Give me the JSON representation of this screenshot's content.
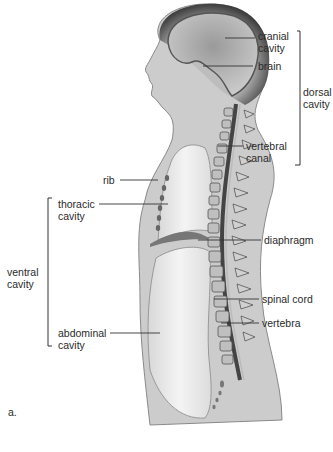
{
  "figure": {
    "panel_label": "a.",
    "labels": {
      "cranial_cavity": "cranial\ncavity",
      "brain": "brain",
      "dorsal_cavity": "dorsal\ncavity",
      "vertebral_canal": "vertebral\ncanal",
      "rib": "rib",
      "thoracic_cavity": "thoracic\ncavity",
      "diaphragm": "diaphragm",
      "ventral_cavity": "ventral\ncavity",
      "spinal_cord": "spinal cord",
      "vertebra": "vertebra",
      "abdominal_cavity": "abdominal\ncavity"
    },
    "colors": {
      "body": "#cfcfcf",
      "skull": "#5a5a5a",
      "cavity": "#ececec",
      "line": "#333333"
    }
  }
}
